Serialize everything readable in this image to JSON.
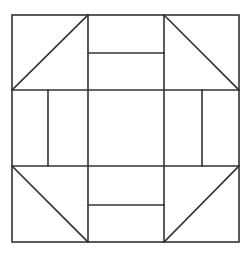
{
  "diagram": {
    "title": "",
    "stroke_color": "#333333",
    "background": "#ffffff",
    "outer_square": {
      "x1": 12,
      "y1": 15,
      "x2": 239,
      "y2": 242
    },
    "grid": {
      "verticals": [
        88,
        164
      ],
      "horizontals": [
        90,
        166
      ]
    },
    "side_bars": {
      "top_split_y": 53,
      "bottom_split_y": 205,
      "left_split_x": 48,
      "right_split_x": 202
    },
    "corner_diagonals": [
      {
        "name": "top-left",
        "x1": 12,
        "y1": 90,
        "x2": 88,
        "y2": 15
      },
      {
        "name": "top-right",
        "x1": 164,
        "y1": 15,
        "x2": 239,
        "y2": 90
      },
      {
        "name": "bottom-left",
        "x1": 12,
        "y1": 166,
        "x2": 88,
        "y2": 242
      },
      {
        "name": "bottom-right",
        "x1": 164,
        "y1": 242,
        "x2": 239,
        "y2": 166
      }
    ]
  }
}
